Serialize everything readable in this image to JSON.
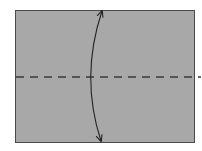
{
  "diagram": {
    "type": "origami-fold-instruction",
    "paper": {
      "x": 15,
      "y": 10,
      "width": 180,
      "height": 133,
      "fill": "#a8a8a8",
      "stroke": "#4a4a4a"
    },
    "fold_line": {
      "style": "dashed",
      "y": 77,
      "x1": 16,
      "x2": 201,
      "color": "#3a3a3a",
      "dash": "8 6"
    },
    "arrow": {
      "type": "double-headed-curved",
      "from": [
        101,
        141
      ],
      "to": [
        102,
        11
      ],
      "bulge_x": 89,
      "color": "#222222"
    },
    "colors": {
      "background": "#ffffff",
      "paper": "#a8a8a8",
      "outline": "#4a4a4a",
      "fold_line": "#3a3a3a",
      "arrow": "#222222"
    }
  }
}
